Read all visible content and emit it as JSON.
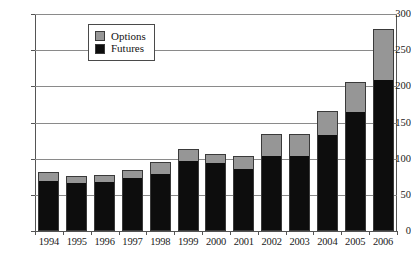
{
  "chart_data": {
    "type": "bar",
    "subtype": "stacked",
    "title": "",
    "xlabel": "",
    "ylabel": "",
    "ylim": [
      0,
      300
    ],
    "ytick_labels": [
      "300",
      "250",
      "200",
      "150",
      "100",
      "50",
      "0"
    ],
    "ytick_values": [
      300,
      250,
      200,
      150,
      100,
      50,
      0
    ],
    "grid": true,
    "legend_position": "top-left-inside",
    "categories": [
      "1994",
      "1995",
      "1996",
      "1997",
      "1998",
      "1999",
      "2000",
      "2001",
      "2002",
      "2003",
      "2004",
      "2005",
      "2006"
    ],
    "series": [
      {
        "name": "Futures",
        "color": "#0d0d0d",
        "values": [
          68,
          65,
          66,
          72,
          78,
          95,
          92,
          85,
          103,
          103,
          131,
          163,
          208
        ]
      },
      {
        "name": "Options",
        "color": "#969696",
        "values": [
          11,
          8,
          8,
          10,
          14,
          15,
          12,
          16,
          28,
          28,
          32,
          40,
          69
        ]
      }
    ],
    "totals": [
      79,
      73,
      74,
      82,
      92,
      110,
      104,
      101,
      131,
      131,
      163,
      203,
      277
    ]
  },
  "legend": {
    "items": [
      {
        "label": "Options",
        "color": "#969696"
      },
      {
        "label": "Futures",
        "color": "#0d0d0d"
      }
    ]
  }
}
